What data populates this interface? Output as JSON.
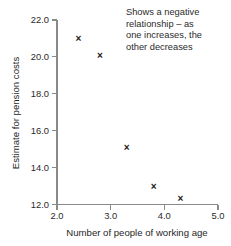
{
  "chart_data": {
    "type": "scatter",
    "title": "",
    "xlabel": "Number of people of working age",
    "ylabel": "Estimate for pension costs",
    "xlim": [
      2.0,
      5.0
    ],
    "ylim": [
      12.0,
      22.0
    ],
    "xticks": [
      "2.0",
      "3.0",
      "4.0",
      "5.0"
    ],
    "xtick_values": [
      2.0,
      3.0,
      4.0,
      5.0
    ],
    "yticks": [
      "12.0",
      "14.0",
      "16.0",
      "18.0",
      "20.0",
      "22.0"
    ],
    "ytick_values": [
      12.0,
      14.0,
      16.0,
      18.0,
      20.0,
      22.0
    ],
    "grid": false,
    "legend": "none",
    "marker": "x",
    "marker_color": "#1a1a1a",
    "points": [
      {
        "x": 2.4,
        "y": 21.0
      },
      {
        "x": 2.8,
        "y": 20.1
      },
      {
        "x": 3.3,
        "y": 15.1
      },
      {
        "x": 3.8,
        "y": 13.0
      },
      {
        "x": 4.3,
        "y": 12.3
      }
    ],
    "annotations": [
      {
        "text": "Shows a negative\nrelationship – as\none increases, the\nother decreases",
        "position": "top-right"
      }
    ]
  },
  "annotation": {
    "text": "Shows a negative\nrelationship – as\none increases, the\nother decreases"
  },
  "axes": {
    "x_title": "Number of people of working age",
    "y_title": "Estimate for pension costs"
  }
}
